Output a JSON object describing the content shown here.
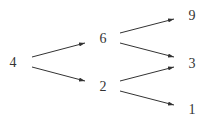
{
  "diagram": {
    "type": "tree",
    "colors": {
      "stroke": "#333333",
      "text": "#333333",
      "background": "#ffffff"
    },
    "nodes": [
      {
        "id": "n4",
        "label": "4",
        "x": 13,
        "y": 67
      },
      {
        "id": "n6",
        "label": "6",
        "x": 103,
        "y": 43
      },
      {
        "id": "n2",
        "label": "2",
        "x": 103,
        "y": 91
      },
      {
        "id": "n9",
        "label": "9",
        "x": 192,
        "y": 20
      },
      {
        "id": "n3",
        "label": "3",
        "x": 192,
        "y": 68
      },
      {
        "id": "n1",
        "label": "1",
        "x": 192,
        "y": 114
      }
    ],
    "edges": [
      {
        "from": "4",
        "to": "6"
      },
      {
        "from": "4",
        "to": "2"
      },
      {
        "from": "6",
        "to": "9"
      },
      {
        "from": "6",
        "to": "3"
      },
      {
        "from": "2",
        "to": "3"
      },
      {
        "from": "2",
        "to": "1"
      }
    ]
  }
}
